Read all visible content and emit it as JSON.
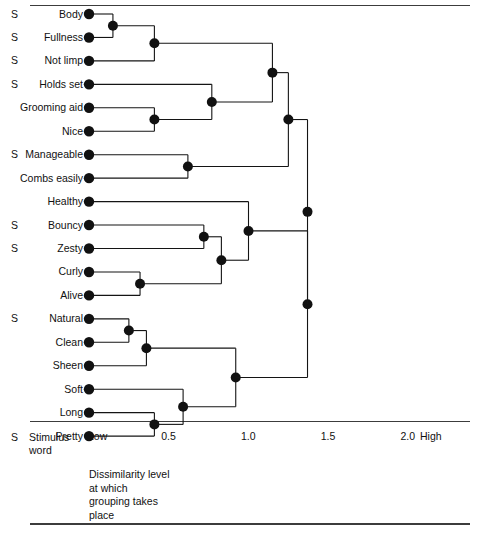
{
  "figure": {
    "line_color": "#141414",
    "node_color": "#111111",
    "rule_color": "#3c3c3c"
  },
  "leaves": [
    {
      "id": "body",
      "label": "Body",
      "stimulus": "S"
    },
    {
      "id": "fullness",
      "label": "Fullness",
      "stimulus": "S"
    },
    {
      "id": "not_limp",
      "label": "Not limp",
      "stimulus": "S"
    },
    {
      "id": "holds_set",
      "label": "Holds set",
      "stimulus": "S"
    },
    {
      "id": "grooming_aid",
      "label": "Grooming aid",
      "stimulus": ""
    },
    {
      "id": "nice",
      "label": "Nice",
      "stimulus": ""
    },
    {
      "id": "manageable",
      "label": "Manageable",
      "stimulus": "S"
    },
    {
      "id": "combs_easily",
      "label": "Combs easily",
      "stimulus": ""
    },
    {
      "id": "healthy",
      "label": "Healthy",
      "stimulus": ""
    },
    {
      "id": "bouncy",
      "label": "Bouncy",
      "stimulus": "S"
    },
    {
      "id": "zesty",
      "label": "Zesty",
      "stimulus": "S"
    },
    {
      "id": "curly",
      "label": "Curly",
      "stimulus": ""
    },
    {
      "id": "alive",
      "label": "Alive",
      "stimulus": ""
    },
    {
      "id": "natural",
      "label": "Natural",
      "stimulus": "S"
    },
    {
      "id": "clean",
      "label": "Clean",
      "stimulus": ""
    },
    {
      "id": "sheen",
      "label": "Sheen",
      "stimulus": ""
    },
    {
      "id": "soft",
      "label": "Soft",
      "stimulus": ""
    },
    {
      "id": "long",
      "label": "Long",
      "stimulus": ""
    },
    {
      "id": "pretty",
      "label": "Pretty",
      "stimulus": ""
    }
  ],
  "axis": {
    "label_low": "Low",
    "label_high": "High",
    "ticks": [
      "0.5",
      "1.0",
      "1.5",
      "2.0"
    ],
    "tick_values": [
      0.5,
      1.0,
      1.5,
      2.0
    ],
    "range": [
      0.0,
      2.0
    ]
  },
  "legend": {
    "marker": "S",
    "text": "Stimulus\nword"
  },
  "caption": "Dissimilarity level\nat which\ngrouping takes\nplace",
  "chart_data": {
    "type": "dendrogram",
    "title": "Dissimilarity level at which grouping takes place",
    "xlabel": "Dissimilarity level",
    "ylabel": "",
    "xlim": [
      0.0,
      2.0
    ],
    "grid": false,
    "orientation": "horizontal-leaves-left",
    "leaf_order": [
      "Body",
      "Fullness",
      "Not limp",
      "Holds set",
      "Grooming aid",
      "Nice",
      "Manageable",
      "Combs easily",
      "Healthy",
      "Bouncy",
      "Zesty",
      "Curly",
      "Alive",
      "Natural",
      "Clean",
      "Sheen",
      "Soft",
      "Long",
      "Pretty"
    ],
    "stimulus_words": [
      "Body",
      "Fullness",
      "Not limp",
      "Holds set",
      "Manageable",
      "Bouncy",
      "Zesty",
      "Natural"
    ],
    "merges": [
      {
        "id": "m1",
        "members": [
          "Body",
          "Fullness"
        ],
        "height": 0.15
      },
      {
        "id": "m2",
        "members": [
          "Body",
          "Fullness",
          "Not limp"
        ],
        "height": 0.41
      },
      {
        "id": "m3",
        "members": [
          "Grooming aid",
          "Nice"
        ],
        "height": 0.41
      },
      {
        "id": "m4",
        "members": [
          "Holds set",
          "Grooming aid",
          "Nice"
        ],
        "height": 0.77
      },
      {
        "id": "m5",
        "members": [
          "Body",
          "Fullness",
          "Not limp",
          "Holds set",
          "Grooming aid",
          "Nice"
        ],
        "height": 1.15
      },
      {
        "id": "m6",
        "members": [
          "Manageable",
          "Combs easily"
        ],
        "height": 0.62
      },
      {
        "id": "m7",
        "members": [
          "Body",
          "Fullness",
          "Not limp",
          "Holds set",
          "Grooming aid",
          "Nice",
          "Manageable",
          "Combs easily"
        ],
        "height": 1.25
      },
      {
        "id": "m8",
        "members": [
          "Bouncy",
          "Zesty"
        ],
        "height": 0.72
      },
      {
        "id": "m9",
        "members": [
          "Curly",
          "Alive"
        ],
        "height": 0.32
      },
      {
        "id": "m10",
        "members": [
          "Bouncy",
          "Zesty",
          "Curly",
          "Alive"
        ],
        "height": 0.83
      },
      {
        "id": "m11",
        "members": [
          "Healthy",
          "Bouncy",
          "Zesty",
          "Curly",
          "Alive"
        ],
        "height": 1.0
      },
      {
        "id": "m12",
        "members": [
          "Natural",
          "Clean"
        ],
        "height": 0.25
      },
      {
        "id": "m13",
        "members": [
          "Natural",
          "Clean",
          "Sheen"
        ],
        "height": 0.36
      },
      {
        "id": "m14",
        "members": [
          "Long",
          "Pretty"
        ],
        "height": 0.41
      },
      {
        "id": "m15",
        "members": [
          "Soft",
          "Long",
          "Pretty"
        ],
        "height": 0.59
      },
      {
        "id": "m16",
        "members": [
          "Natural",
          "Clean",
          "Sheen",
          "Soft",
          "Long",
          "Pretty"
        ],
        "height": 0.92
      },
      {
        "id": "m17",
        "members": [
          "Healthy",
          "Bouncy",
          "Zesty",
          "Curly",
          "Alive",
          "Natural",
          "Clean",
          "Sheen",
          "Soft",
          "Long",
          "Pretty"
        ],
        "height": 1.37
      },
      {
        "id": "root",
        "members": [
          "all"
        ],
        "height": 1.37
      }
    ]
  }
}
